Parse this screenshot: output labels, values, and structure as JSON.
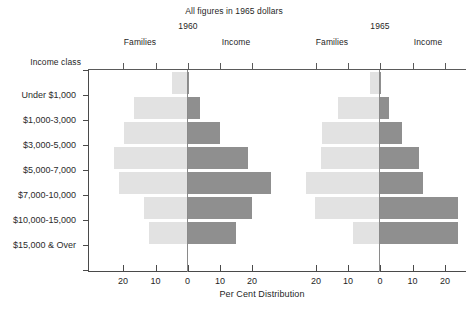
{
  "header": {
    "title": "All figures in 1965 dollars",
    "year_left": "1960",
    "year_right": "1965",
    "group_labels": [
      "Families",
      "Income",
      "Families",
      "Income"
    ],
    "income_class_label": "Income class"
  },
  "axis": {
    "x_title": "Per Cent Distribution",
    "x_tick_labels": [
      "20",
      "10",
      "0",
      "10",
      "20",
      "20",
      "10",
      "0",
      "10",
      "20"
    ],
    "y_categories": [
      "Under $1,000",
      "$1,000-3,000",
      "$3,000-5,000",
      "$5,000-7,000",
      "$7,000-10,000",
      "$10,000-15,000",
      "$15,000 & Over"
    ]
  },
  "caption": "",
  "colors": {
    "families_bar": "#e2e2e2",
    "income_bar": "#8f8f8f",
    "axis": "#4a4a4a",
    "text": "#1f1f1f"
  },
  "chart_data": {
    "type": "bar",
    "title": "All figures in 1965 dollars",
    "xlabel": "Per Cent Distribution",
    "ylabel": "Income class",
    "orientation": "horizontal",
    "layout": "butterfly-pyramid-pair",
    "panels": [
      {
        "name": "1960",
        "left_series": "Families",
        "right_series": "Income",
        "xlim": [
          25,
          0,
          25
        ],
        "x_ticks": [
          20,
          10,
          0,
          10,
          20
        ]
      },
      {
        "name": "1965",
        "left_series": "Families",
        "right_series": "Income",
        "xlim": [
          25,
          0,
          25
        ],
        "x_ticks": [
          20,
          10,
          0,
          10,
          20
        ]
      }
    ],
    "categories": [
      "Under $1,000",
      "$1,000-3,000",
      "$3,000-5,000",
      "$5,000-7,000",
      "$7,000-10,000",
      "$10,000-15,000",
      "$15,000 & Over"
    ],
    "series": [
      {
        "name": "1960 Families",
        "panel": 0,
        "side": "left",
        "values": [
          4.6,
          16.5,
          19.8,
          22.9,
          21.3,
          13.4,
          11.9
        ]
      },
      {
        "name": "1960 Income",
        "panel": 0,
        "side": "right",
        "values": [
          0.4,
          3.9,
          10.1,
          18.6,
          25.8,
          20.1,
          15.0
        ]
      },
      {
        "name": "1965 Families",
        "panel": 1,
        "side": "left",
        "values": [
          2.8,
          12.8,
          17.7,
          18.2,
          22.9,
          20.0,
          8.1
        ]
      },
      {
        "name": "1965 Income",
        "panel": 1,
        "side": "right",
        "values": [
          0.3,
          2.9,
          6.8,
          12.2,
          13.5,
          24.4,
          24.4
        ]
      }
    ],
    "grid": false,
    "legend": "none"
  }
}
